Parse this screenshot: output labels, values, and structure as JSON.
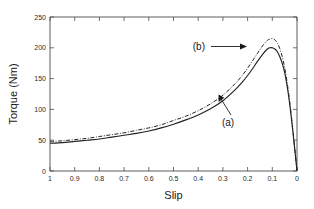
{
  "chart_data": {
    "type": "line",
    "title": "",
    "xlabel": "Slip",
    "ylabel": "Torque (Nm)",
    "xlim": [
      1,
      0
    ],
    "ylim": [
      0,
      250
    ],
    "x_reversed": true,
    "grid": false,
    "legend_position": "inline-annotations",
    "xticks": [
      "1",
      "0.9",
      "0.8",
      "0.7",
      "0.6",
      "0.5",
      "0.4",
      "0.3",
      "0.2",
      "0.1",
      "0"
    ],
    "xtick_values": [
      1,
      0.9,
      0.8,
      0.7,
      0.6,
      0.5,
      0.4,
      0.3,
      0.2,
      0.1,
      0
    ],
    "yticks": [
      "0",
      "50",
      "100",
      "150",
      "200",
      "250"
    ],
    "ytick_values": [
      0,
      50,
      100,
      150,
      200,
      250
    ],
    "x": [
      1.0,
      0.95,
      0.9,
      0.85,
      0.8,
      0.75,
      0.7,
      0.65,
      0.6,
      0.55,
      0.5,
      0.45,
      0.4,
      0.35,
      0.3,
      0.25,
      0.22,
      0.2,
      0.18,
      0.16,
      0.14,
      0.12,
      0.11,
      0.1,
      0.09,
      0.08,
      0.07,
      0.06,
      0.05,
      0.04,
      0.03,
      0.02,
      0.01,
      0.0
    ],
    "series": [
      {
        "name": "(a)",
        "style": "solid",
        "values": [
          45,
          46,
          48,
          50,
          52,
          55,
          58,
          61,
          65,
          70,
          76,
          83,
          91,
          101,
          114,
          132,
          145,
          155,
          166,
          178,
          189,
          198,
          200,
          200,
          198,
          194,
          186,
          175,
          160,
          138,
          110,
          76,
          39,
          0
        ]
      },
      {
        "name": "(b)",
        "style": "dash-dot",
        "values": [
          48,
          49,
          51,
          53,
          56,
          59,
          62,
          66,
          70,
          75,
          82,
          89,
          98,
          109,
          123,
          142,
          156,
          167,
          179,
          191,
          203,
          212,
          214,
          215,
          213,
          208,
          199,
          186,
          168,
          144,
          114,
          79,
          40,
          0
        ]
      }
    ],
    "annotations": [
      {
        "text": "(b)",
        "label_x_px": 205,
        "label_y_px": 50,
        "arrow_from_px": [
          221,
          47
        ],
        "arrow_to_px": [
          246,
          47
        ],
        "points_to_series": "(b)"
      },
      {
        "text": "(a)",
        "label_x_px": 226,
        "label_y_px": 122,
        "arrow_from_px": [
          232,
          113
        ],
        "arrow_to_px": [
          219,
          95
        ],
        "points_to_series": "(a)"
      }
    ]
  },
  "axes": {
    "x_title": "Slip",
    "y_title": "Torque (Nm)"
  }
}
